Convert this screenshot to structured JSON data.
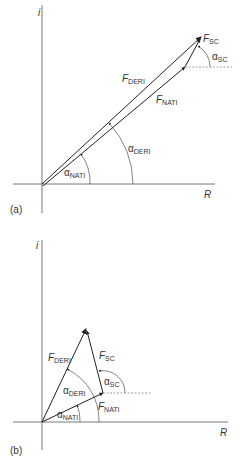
{
  "panel_a": {
    "tag": "(a)",
    "axis_x": "R",
    "axis_y": "i",
    "labels": {
      "fsc_main": "F",
      "fsc_sub": "SC",
      "asc_main": "α",
      "asc_sub": "SC",
      "fderi_main": "F",
      "fderi_sub": "DERI",
      "fnati_main": "F",
      "fnati_sub": "NATI",
      "aderi_main": "α",
      "aderi_sub": "DERI",
      "anati_main": "α",
      "anati_sub": "NATI"
    }
  },
  "panel_b": {
    "tag": "(b)",
    "axis_x": "R",
    "axis_y": "i",
    "labels": {
      "fderi_main": "F",
      "fderi_sub": "DERI",
      "fsc_main": "F",
      "fsc_sub": "SC",
      "asc_main": "α",
      "asc_sub": "SC",
      "aderi_main": "α",
      "aderi_sub": "DERI",
      "fnati_main": "F",
      "fnati_sub": "NATI",
      "anati_main": "α",
      "anati_sub": "NATI"
    }
  },
  "colors": {
    "line": "#333333",
    "axis": "#555555",
    "dotted": "#888888"
  }
}
